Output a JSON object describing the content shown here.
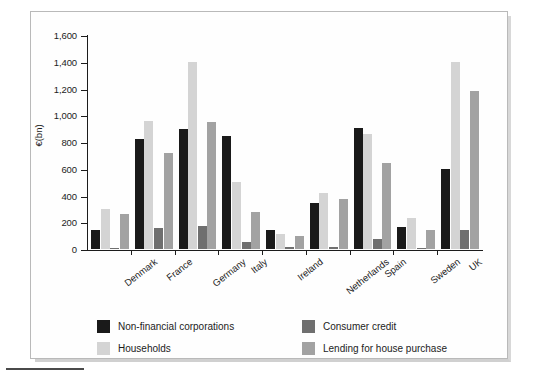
{
  "chart_data": {
    "type": "bar",
    "title": "",
    "xlabel": "",
    "ylabel": "€(bn)",
    "ylim": [
      0,
      1600
    ],
    "ytick_labels": [
      "0",
      "200",
      "400",
      "600",
      "800",
      "1,000",
      "1,200",
      "1,400",
      "1,600"
    ],
    "ytick_values": [
      0,
      200,
      400,
      600,
      800,
      1000,
      1200,
      1400,
      1600
    ],
    "grid": false,
    "legend_position": "bottom",
    "categories": [
      "Denmark",
      "France",
      "Germany",
      "Italy",
      "Ireland",
      "Netherlands",
      "Spain",
      "Sweden",
      "UK"
    ],
    "series": [
      {
        "name": "Non-financial corporations",
        "color": "#1a1a1a",
        "values": [
          145,
          825,
          900,
          845,
          140,
          345,
          905,
          165,
          600
        ]
      },
      {
        "name": "Households",
        "color": "#d4d4d4",
        "values": [
          300,
          955,
          1400,
          500,
          115,
          420,
          860,
          235,
          1400
        ]
      },
      {
        "name": "Consumer credit",
        "color": "#6f6f6f",
        "values": [
          10,
          155,
          170,
          55,
          18,
          15,
          75,
          8,
          140
        ]
      },
      {
        "name": "Lending for house purchase",
        "color": "#a2a2a2",
        "values": [
          265,
          715,
          950,
          280,
          95,
          375,
          640,
          145,
          1180
        ]
      }
    ]
  }
}
